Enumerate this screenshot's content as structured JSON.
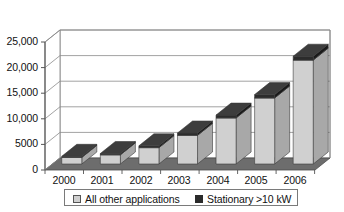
{
  "chart_data": {
    "type": "bar",
    "title": "",
    "subtitle": "",
    "xlabel": "",
    "ylabel": "",
    "categories": [
      "2000",
      "2001",
      "2002",
      "2003",
      "2004",
      "2005",
      "2006"
    ],
    "ylim": [
      0,
      25000
    ],
    "yticks": [
      0,
      5000,
      10000,
      15000,
      20000,
      25000
    ],
    "ytick_labels": [
      "0",
      "5000",
      "10,000",
      "15,000",
      "20,000",
      "25,000"
    ],
    "grid": true,
    "style": "3d-column",
    "legend_position": "bottom",
    "series": [
      {
        "name": "All other applications",
        "color": "#d0d0d0",
        "values": [
          1300,
          1800,
          3200,
          5600,
          9000,
          12900,
          20300
        ]
      },
      {
        "name": "Stationary >10 kW",
        "color": "#2b2b2b",
        "values": [
          200,
          250,
          350,
          450,
          550,
          650,
          750
        ]
      }
    ],
    "totals": [
      1500,
      2050,
      3550,
      6050,
      9550,
      13550,
      21050
    ]
  },
  "legend": {
    "entries": [
      {
        "label": "All other applications",
        "swatch": "light-gray-square"
      },
      {
        "label": "Stationary >10 kW",
        "swatch": "dark-square"
      }
    ]
  },
  "colors": {
    "bar_light": "#d0d0d0",
    "bar_light_side": "#a8a8a8",
    "bar_dark": "#2b2b2b",
    "bar_dark_side": "#1a1a1a",
    "floor": "#6d6d6d",
    "wall": "#ffffff",
    "gridline": "#8a8a8a",
    "axis": "#555555",
    "text": "#111111"
  }
}
